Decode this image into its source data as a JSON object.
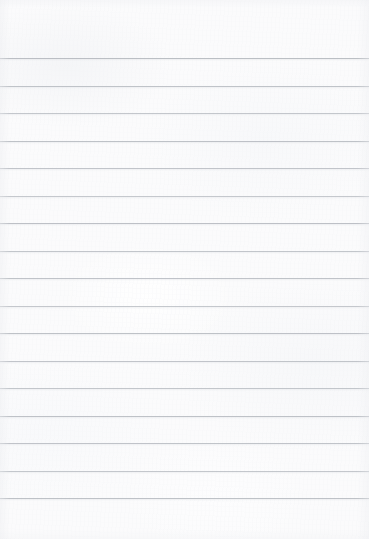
{
  "document": {
    "kind": "scanned-lined-notebook-paper",
    "title": "Blank Ruled Notepad Page",
    "content_text": "",
    "has_written_content": false,
    "page_width_px": 369,
    "page_height_px": 539
  },
  "paper": {
    "background_color": "#fbfbfc",
    "edge_shade_color": "#eef0f2",
    "texture": "subtle mottled fibrous scan grain"
  },
  "ruling": {
    "style": "horizontal-ruled",
    "line_color": "#b8bcc2",
    "line_thickness_px": 1,
    "line_spacing_px": 27.5,
    "first_line_y_px": 58,
    "last_line_y_px": 498,
    "top_margin_px": 58,
    "bottom_margin_px": 41,
    "left_margin_rule": false,
    "right_margin_rule": false,
    "line_count": 17,
    "line_positions_y_px": [
      58,
      85.5,
      113,
      140.5,
      168,
      195.5,
      223,
      250.5,
      278,
      305.5,
      333,
      360.5,
      388,
      415.5,
      443,
      470.5,
      498
    ],
    "line_opacities": [
      0.95,
      0.88,
      0.82,
      0.9,
      0.86,
      0.8,
      0.92,
      0.84,
      0.88,
      0.81,
      0.9,
      0.86,
      0.83,
      0.9,
      0.87,
      0.82,
      0.9
    ]
  }
}
